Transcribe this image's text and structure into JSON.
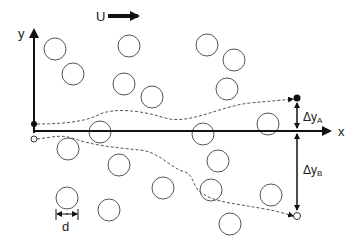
{
  "labels": {
    "flow": "U",
    "y_axis": "y",
    "x_axis": "x",
    "delta_a": "Δy",
    "delta_a_sub": "A",
    "delta_b": "Δy",
    "delta_b_sub": "B",
    "diameter": "d"
  },
  "colors": {
    "stroke": "#333333",
    "circle": "#555555",
    "dash": "#555555"
  },
  "circles": [
    [
      55,
      49
    ],
    [
      73,
      74
    ],
    [
      129,
      46
    ],
    [
      207,
      45
    ],
    [
      124,
      84
    ],
    [
      152,
      97
    ],
    [
      234,
      60
    ],
    [
      227,
      89
    ],
    [
      100,
      132
    ],
    [
      203,
      134
    ],
    [
      268,
      124
    ],
    [
      68,
      149
    ],
    [
      119,
      165
    ],
    [
      67,
      198
    ],
    [
      109,
      210
    ],
    [
      218,
      161
    ],
    [
      163,
      188
    ],
    [
      211,
      190
    ],
    [
      271,
      195
    ],
    [
      230,
      224
    ]
  ]
}
